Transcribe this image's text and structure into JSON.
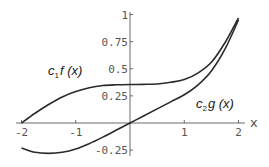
{
  "chart_data": {
    "type": "line",
    "title": "",
    "xlabel": "x",
    "ylabel": "",
    "xlim": [
      -2,
      2
    ],
    "ylim": [
      -0.3,
      1
    ],
    "grid": false,
    "legend": "inline labels",
    "x_ticks": [
      -2,
      -1,
      1,
      2
    ],
    "x_tick_labels": [
      "-2",
      "-1",
      "1",
      "2"
    ],
    "y_ticks": [
      -0.25,
      0.25,
      0.5,
      0.75,
      1
    ],
    "y_tick_labels": [
      "-0.25",
      "0.25",
      "0.5",
      "0.75",
      "1"
    ],
    "series": [
      {
        "name": "c1f(x)",
        "label_main": "c",
        "label_sub": "1",
        "label_rest": "f (x)",
        "x": [
          -2,
          -1.75,
          -1.5,
          -1.25,
          -1,
          -0.75,
          -0.5,
          -0.25,
          0,
          0.25,
          0.5,
          0.75,
          1,
          1.25,
          1.5,
          1.75,
          2
        ],
        "y": [
          0,
          0.09,
          0.17,
          0.24,
          0.29,
          0.325,
          0.345,
          0.352,
          0.355,
          0.356,
          0.36,
          0.375,
          0.4,
          0.46,
          0.56,
          0.74,
          0.97
        ]
      },
      {
        "name": "c2g(x)",
        "label_main": "c",
        "label_sub": "2",
        "label_rest": "g (x)",
        "x": [
          -2,
          -1.75,
          -1.5,
          -1.25,
          -1,
          -0.75,
          -0.5,
          -0.25,
          0,
          0.25,
          0.5,
          0.75,
          1,
          1.25,
          1.5,
          1.75,
          2
        ],
        "y": [
          -0.23,
          -0.27,
          -0.28,
          -0.27,
          -0.24,
          -0.19,
          -0.13,
          -0.065,
          0,
          0.065,
          0.13,
          0.195,
          0.26,
          0.35,
          0.48,
          0.68,
          0.95
        ]
      }
    ]
  }
}
